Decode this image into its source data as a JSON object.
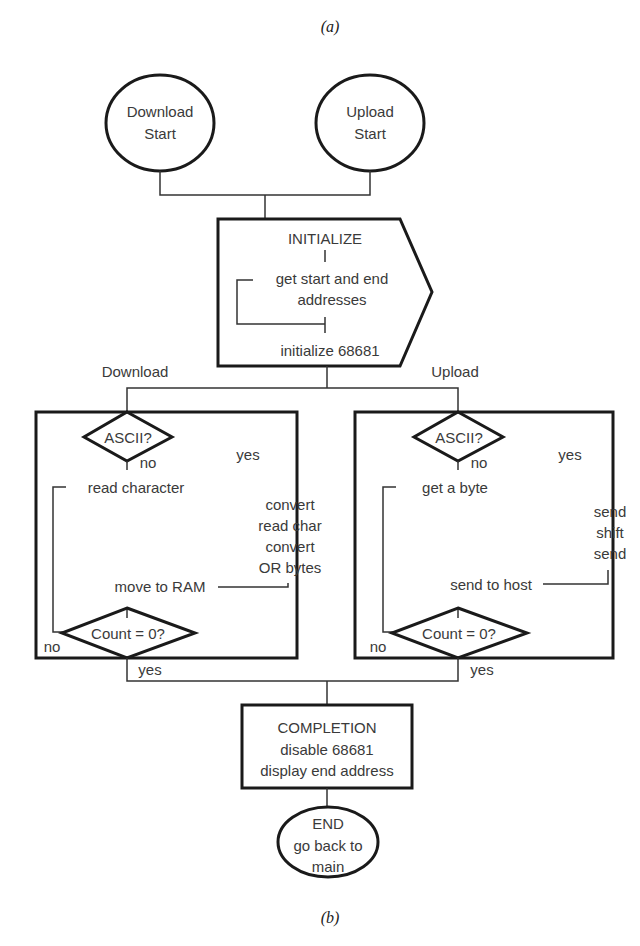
{
  "captions": {
    "top": "(a)",
    "bottom": "(b)"
  },
  "start_nodes": {
    "download": {
      "line1": "Download",
      "line2": "Start"
    },
    "upload": {
      "line1": "Upload",
      "line2": "Start"
    }
  },
  "initialize": {
    "title": "INITIALIZE",
    "step1_line1": "get start and end",
    "step1_line2": "addresses",
    "step2": "initialize 68681"
  },
  "branches": {
    "download_label": "Download",
    "upload_label": "Upload"
  },
  "download_loop": {
    "decision": "ASCII?",
    "no_label": "no",
    "yes_label": "yes",
    "no_path": "read character",
    "yes_path": [
      "convert",
      "read char",
      "convert",
      "OR bytes"
    ],
    "merge_step": "move to RAM",
    "count_decision": "Count = 0?",
    "loop_no": "no",
    "exit_yes": "yes"
  },
  "upload_loop": {
    "decision": "ASCII?",
    "no_label": "no",
    "yes_label": "yes",
    "no_path": "get a byte",
    "yes_path": [
      "send",
      "shift",
      "send"
    ],
    "merge_step": "send to host",
    "count_decision": "Count = 0?",
    "loop_no": "no",
    "exit_yes": "yes"
  },
  "completion": {
    "title": "COMPLETION",
    "line1": "disable 68681",
    "line2": "display end address"
  },
  "end_node": {
    "line1": "END",
    "line2": "go back to",
    "line3": "main"
  }
}
